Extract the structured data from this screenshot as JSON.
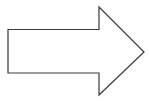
{
  "diagram": {
    "shape": "right-arrow",
    "stroke_color": "#3a3a3a",
    "fill_color": "#ffffff",
    "background": "#ffffff"
  }
}
